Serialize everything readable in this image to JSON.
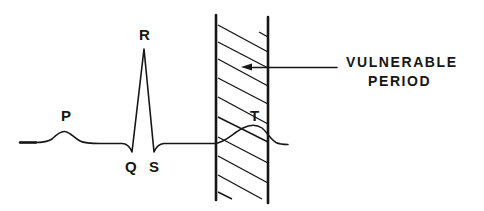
{
  "diagram": {
    "type": "ecg-waveform-with-vulnerable-period",
    "wave_labels": {
      "p": "P",
      "q": "Q",
      "r": "R",
      "s": "S",
      "t": "T"
    },
    "callout": {
      "line1": "VULNERABLE",
      "line2": "PERIOD"
    },
    "colors": {
      "ink": "#161616",
      "background": "#ffffff"
    }
  }
}
